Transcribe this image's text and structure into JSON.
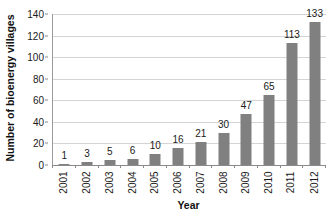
{
  "chart_data": {
    "type": "bar",
    "title": "",
    "xlabel": "Year",
    "ylabel": "Number of bioenergy villages",
    "categories": [
      "2001",
      "2002",
      "2003",
      "2004",
      "2005",
      "2006",
      "2007",
      "2008",
      "2009",
      "2010",
      "2011",
      "2012"
    ],
    "values": [
      1,
      3,
      5,
      6,
      10,
      16,
      21,
      30,
      47,
      65,
      113,
      133
    ],
    "value_labels": [
      "1",
      "3",
      "5",
      "6",
      "10",
      "16",
      "21",
      "30",
      "47",
      "65",
      "113",
      "133"
    ],
    "ylim": [
      0,
      140
    ],
    "y_ticks": [
      0,
      20,
      40,
      60,
      80,
      100,
      120,
      140
    ],
    "y_tick_labels": [
      "0",
      "20",
      "40",
      "60",
      "80",
      "100",
      "120",
      "140"
    ],
    "grid": true,
    "legend": "none",
    "bar_color": "#808080",
    "gridline_color": "#d4d4d4",
    "axis_color": "#8a8a8a",
    "text_color": "#1a1a1a",
    "show_value_labels": true,
    "x_tick_label_rotation": "-90",
    "y_axis_title_rotation": "-90"
  }
}
